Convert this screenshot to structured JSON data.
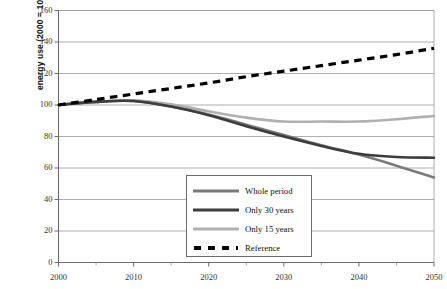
{
  "chart_data": {
    "type": "line",
    "title": "",
    "xlabel": "",
    "ylabel": "energy use (2000 = 100)",
    "xlim": [
      2000,
      2050
    ],
    "ylim": [
      0,
      160
    ],
    "ytick_labels": [
      "160",
      "140",
      "120",
      "100",
      "80",
      "60",
      "40",
      "20",
      "0"
    ],
    "ytick_values": [
      160,
      140,
      120,
      100,
      80,
      60,
      40,
      20,
      0
    ],
    "xtick_labels": [
      "2000",
      "2010",
      "2020",
      "2030",
      "2040",
      "2050"
    ],
    "xtick_values": [
      2000,
      2010,
      2020,
      2030,
      2040,
      2050
    ],
    "minor_xtick_values": [
      2005,
      2015,
      2025,
      2035,
      2045
    ],
    "grid": "horizontal",
    "legend_position": "lower-center",
    "x": [
      2000,
      2005,
      2010,
      2015,
      2020,
      2025,
      2030,
      2035,
      2040,
      2045,
      2050
    ],
    "series": [
      {
        "name": "Whole period",
        "color": "#7a7a7a",
        "style": "solid",
        "width": 2.6,
        "values": [
          100,
          102,
          102.5,
          99,
          94,
          87.5,
          81,
          74.5,
          68.5,
          61.5,
          54
        ]
      },
      {
        "name": "Only 30 years",
        "color": "#3d3d3d",
        "style": "solid",
        "width": 2.6,
        "values": [
          100,
          102,
          102.5,
          99,
          93.5,
          86.5,
          80,
          74,
          69,
          67,
          66.5
        ]
      },
      {
        "name": "Only 15 years",
        "color": "#b0b0b0",
        "style": "solid",
        "width": 2.6,
        "values": [
          100,
          102,
          103,
          100.5,
          96,
          92,
          89.5,
          89.5,
          89.5,
          91,
          93
        ]
      },
      {
        "name": "Reference",
        "color": "#000000",
        "style": "dashed",
        "width": 3.2,
        "values": [
          100,
          103.5,
          107,
          110.5,
          114,
          118,
          121.5,
          125,
          128.5,
          132,
          136
        ]
      }
    ]
  },
  "legend": {
    "items": [
      {
        "label": "Whole period"
      },
      {
        "label": "Only 30 years"
      },
      {
        "label": "Only 15 years"
      },
      {
        "label": "Reference"
      }
    ]
  }
}
